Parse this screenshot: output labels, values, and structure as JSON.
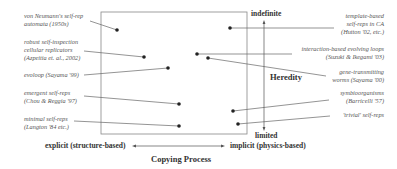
{
  "diagram": {
    "vertical_axis": {
      "title": "Heredity",
      "top_label": "indefinite",
      "bottom_label": "limited"
    },
    "horizontal_axis": {
      "title": "Copying Process",
      "left_label": "explicit (structure-based)",
      "right_label": "implicit (physics-based)"
    },
    "left_items": [
      {
        "line1": "von Neumann's self-rep",
        "line2": "automata (1950s)"
      },
      {
        "line1": "robust self-inspection",
        "line2": "cellular replicators",
        "line3": "(Azpeitia et. al., 2002)"
      },
      {
        "line1": "evoloop (Sayama '99)"
      },
      {
        "line1": "emergent self-reps",
        "line2": "(Chou & Reggia '97)"
      },
      {
        "line1": "minimal self-reps",
        "line2": "(Langton '84 etc.)"
      }
    ],
    "right_items": [
      {
        "line1": "template-based",
        "line2": "self-reps in CA",
        "line3": "(Hutton '02, etc.)"
      },
      {
        "line1": "interaction-based evolving loops",
        "line2": "(Suzuki & Ikegami '03)"
      },
      {
        "line1": "gene-transmitting",
        "line2": "worms (Sayama '00)"
      },
      {
        "line1": "symbioorganisms",
        "line2": "(Barricelli '57)"
      },
      {
        "line1": "'trivial' self-reps"
      }
    ],
    "colors": {
      "line": "#666666",
      "dot": "#222222",
      "text": "#333333",
      "label": "#555555"
    }
  }
}
